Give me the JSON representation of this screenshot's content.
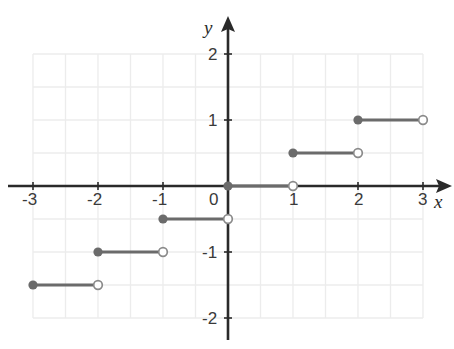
{
  "chart_data": {
    "type": "line",
    "title": "",
    "xlabel": "x",
    "ylabel": "y",
    "xlim": [
      -3,
      3
    ],
    "ylim": [
      -2,
      2
    ],
    "grid": true,
    "grid_step": 0.5,
    "legend": "none",
    "function": "f(x) = 0.5 * floor(x)",
    "x_ticks": [
      -3,
      -2,
      -1,
      0,
      1,
      2,
      3
    ],
    "x_tick_labels": [
      "-3",
      "-2",
      "-1",
      "0",
      "1",
      "2",
      "3"
    ],
    "y_ticks": [
      -2,
      -1,
      1,
      2
    ],
    "y_tick_labels": [
      "-2",
      "-1",
      "1",
      "2"
    ],
    "series": [
      {
        "name": "step",
        "style": "step-segments",
        "segments": [
          {
            "x_start": -3,
            "x_end": -2,
            "y": -1.5,
            "left_endpoint": "closed",
            "right_endpoint": "open"
          },
          {
            "x_start": -2,
            "x_end": -1,
            "y": -1.0,
            "left_endpoint": "closed",
            "right_endpoint": "open"
          },
          {
            "x_start": -1,
            "x_end": 0,
            "y": -0.5,
            "left_endpoint": "closed",
            "right_endpoint": "open"
          },
          {
            "x_start": 0,
            "x_end": 1,
            "y": 0.0,
            "left_endpoint": "closed",
            "right_endpoint": "open"
          },
          {
            "x_start": 1,
            "x_end": 2,
            "y": 0.5,
            "left_endpoint": "closed",
            "right_endpoint": "open"
          },
          {
            "x_start": 2,
            "x_end": 3,
            "y": 1.0,
            "left_endpoint": "closed",
            "right_endpoint": "open"
          }
        ]
      }
    ]
  },
  "colors": {
    "background": "#ffffff",
    "grid": "#ececec",
    "axis": "#2a2a2a",
    "curve": "#6b6b6b",
    "closed_point_fill": "#6b6b6b",
    "open_point_fill": "#ffffff",
    "open_point_stroke": "#8a8a8a",
    "tick_label": "#3a3a3a"
  },
  "axes": {
    "x_name": "x",
    "y_name": "y"
  },
  "tick_labels": {
    "x": [
      {
        "text": "-3",
        "left": 22,
        "top": 191
      },
      {
        "text": "-2",
        "left": 87,
        "top": 191
      },
      {
        "text": "-1",
        "left": 152,
        "top": 191
      },
      {
        "text": "0",
        "left": 209,
        "top": 191
      },
      {
        "text": "1",
        "left": 289,
        "top": 191
      },
      {
        "text": "2",
        "left": 354,
        "top": 191
      },
      {
        "text": "3",
        "left": 418,
        "top": 191
      }
    ],
    "y": [
      {
        "text": "2",
        "left": 208,
        "top": 46
      },
      {
        "text": "1",
        "left": 208,
        "top": 112
      },
      {
        "text": "-1",
        "left": 202,
        "top": 244
      },
      {
        "text": "-2",
        "left": 202,
        "top": 310
      }
    ]
  },
  "axis_names": {
    "x": {
      "text": "x",
      "left": 434,
      "top": 192
    },
    "y": {
      "text": "y",
      "left": 204,
      "top": 18
    }
  }
}
